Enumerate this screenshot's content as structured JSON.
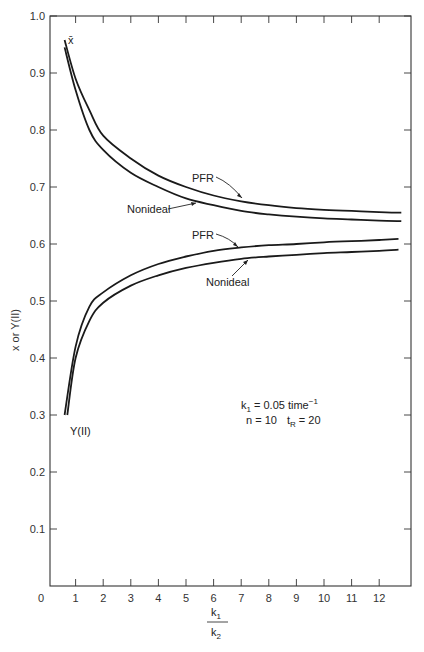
{
  "chart_data": {
    "type": "line",
    "title": "",
    "xlabel": "k1/k2",
    "xlabel_numerator": "k",
    "xlabel_numerator_sub": "1",
    "xlabel_denominator": "k",
    "xlabel_denominator_sub": "2",
    "ylabel": "x or Y(II)",
    "xlim": [
      0,
      13
    ],
    "ylim": [
      0,
      1.0
    ],
    "grid": false,
    "x_ticks": [
      0,
      1,
      2,
      3,
      4,
      5,
      6,
      7,
      8,
      9,
      10,
      11,
      12
    ],
    "x_tick_labels": [
      "0",
      "1",
      "2",
      "3",
      "4",
      "5",
      "6",
      "7",
      "8",
      "9",
      "10",
      "11",
      "12"
    ],
    "y_ticks": [
      0.1,
      0.2,
      0.3,
      0.4,
      0.5,
      0.6,
      0.7,
      0.8,
      0.9,
      1.0
    ],
    "y_tick_labels": [
      "0.1",
      "0.2",
      "0.3",
      "0.4",
      "0.5",
      "0.6",
      "0.7",
      "0.8",
      "0.9",
      "1.0"
    ],
    "series": [
      {
        "name": "x̄ PFR",
        "group": "x̄",
        "x": [
          0.6,
          1,
          1.5,
          2,
          3,
          4,
          5,
          6,
          7,
          8,
          9,
          10,
          11,
          12,
          12.8
        ],
        "values": [
          0.958,
          0.89,
          0.835,
          0.79,
          0.75,
          0.72,
          0.7,
          0.685,
          0.675,
          0.668,
          0.663,
          0.66,
          0.658,
          0.656,
          0.655
        ]
      },
      {
        "name": "x̄ Nonideal",
        "group": "x̄",
        "x": [
          0.6,
          1,
          1.5,
          2,
          3,
          4,
          5,
          6,
          7,
          8,
          9,
          10,
          11,
          12,
          12.8
        ],
        "values": [
          0.945,
          0.87,
          0.8,
          0.765,
          0.725,
          0.7,
          0.68,
          0.668,
          0.658,
          0.652,
          0.648,
          0.645,
          0.643,
          0.641,
          0.64
        ]
      },
      {
        "name": "Y(II) PFR",
        "group": "Y(II)",
        "x": [
          0.6,
          1,
          1.5,
          2,
          3,
          4,
          5,
          6,
          7,
          8,
          9,
          10,
          11,
          12,
          12.7
        ],
        "values": [
          0.3,
          0.42,
          0.49,
          0.515,
          0.545,
          0.565,
          0.578,
          0.588,
          0.594,
          0.598,
          0.6,
          0.603,
          0.605,
          0.607,
          0.609
        ]
      },
      {
        "name": "Y(II) Nonideal",
        "group": "Y(II)",
        "x": [
          0.7,
          1,
          1.5,
          2,
          3,
          4,
          5,
          6,
          7,
          8,
          9,
          10,
          11,
          12,
          12.7
        ],
        "values": [
          0.3,
          0.4,
          0.465,
          0.497,
          0.527,
          0.545,
          0.558,
          0.567,
          0.574,
          0.578,
          0.581,
          0.584,
          0.586,
          0.588,
          0.59
        ]
      }
    ],
    "annotations": {
      "xbar_label": "x̄",
      "yII_label": "Y(II)",
      "upper_pfr": "PFR",
      "upper_nonideal": "Nonideal",
      "lower_pfr": "PFR",
      "lower_nonideal": "Nonideal",
      "param_line1_prefix": "k",
      "param_line1_sub": "1",
      "param_line1_rest": " = 0.05 time",
      "param_line1_sup": "−1",
      "param_line2_n": "n = 10",
      "param_line2_t": "t",
      "param_line2_tsub": "R",
      "param_line2_rest": " = 20"
    }
  }
}
